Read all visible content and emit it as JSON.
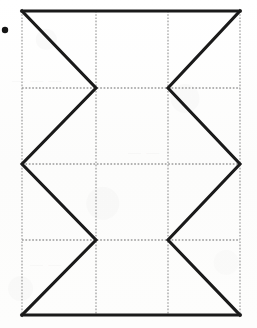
{
  "figure": {
    "background_color": "#fdfdfc",
    "stroke_color": "#1a1a1a",
    "grid_color": "#9a9a9a",
    "bullet_color": "#141414",
    "frame": {
      "left": 22,
      "top": 11,
      "right": 240,
      "bottom": 315
    },
    "grid": {
      "vertical_lines_x": [
        96,
        168
      ],
      "horizontal_lines_y": [
        88,
        164,
        240
      ],
      "columns": 3,
      "rows": 4,
      "style": "dotted"
    },
    "bullet_marker": {
      "cx": 5,
      "cy": 30,
      "r": 3.2
    },
    "left_zigzag_points": "22,11 96,88 22,164 96,240 22,315",
    "right_zigzag_points": "240,11 168,88 240,164 168,240 240,315",
    "outline_top": "22,11 240,11",
    "outline_bottom": "22,315 240,315",
    "ghost_marks": [
      {
        "text": "— — —",
        "x": 12,
        "y": 78
      },
      {
        "text": "—  —",
        "x": 128,
        "y": 150
      },
      {
        "text": "— —",
        "x": 30,
        "y": 262
      }
    ]
  },
  "chart_data": {
    "type": "line",
    "title": "",
    "xlabel": "",
    "ylabel": "",
    "xlim": [
      22,
      240
    ],
    "ylim": [
      11,
      315
    ],
    "grid": true,
    "legend": "none",
    "categories": [],
    "series": [
      {
        "name": "left-zigzag",
        "x": [
          22,
          96,
          22,
          96,
          22
        ],
        "y": [
          11,
          88,
          164,
          240,
          315
        ]
      },
      {
        "name": "right-zigzag",
        "x": [
          240,
          168,
          240,
          168,
          240
        ],
        "y": [
          11,
          88,
          164,
          240,
          315
        ]
      },
      {
        "name": "top-edge",
        "x": [
          22,
          240
        ],
        "y": [
          11,
          11
        ]
      },
      {
        "name": "bottom-edge",
        "x": [
          22,
          240
        ],
        "y": [
          315,
          315
        ]
      }
    ],
    "xticks": [
      22,
      96,
      168,
      240
    ],
    "yticks": [
      11,
      88,
      164,
      240,
      315
    ],
    "xtick_labels": [
      "",
      "",
      "",
      ""
    ],
    "ytick_labels": [
      "",
      "",
      "",
      "",
      ""
    ]
  }
}
